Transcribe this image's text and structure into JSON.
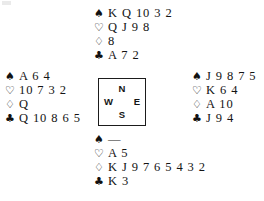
{
  "diagram": {
    "type": "bridge-hand-deal",
    "suit_symbols": {
      "spades": "♠",
      "hearts": "♡",
      "diamonds": "♢",
      "clubs": "♣"
    },
    "void_marker": "—",
    "compass": {
      "north": "N",
      "east": "E",
      "south": "S",
      "west": "W"
    },
    "hands": {
      "north": {
        "seat": "North",
        "spades": "K Q 10 3 2",
        "hearts": "Q J 9 8",
        "diamonds": "8",
        "clubs": "A 7 2"
      },
      "west": {
        "seat": "West",
        "spades": "A 6 4",
        "hearts": "10 7 3 2",
        "diamonds": "Q",
        "clubs": "Q 10 8 6 5"
      },
      "east": {
        "seat": "East",
        "spades": "J 9 8 7 5",
        "hearts": "K 6 4",
        "diamonds": "A 10",
        "clubs": "J 9 4"
      },
      "south": {
        "seat": "South",
        "spades": "—",
        "hearts": "A 5",
        "diamonds": "K J 9 7 6 5 4 3 2",
        "clubs": "K 3"
      }
    },
    "colors": {
      "background": "#ffffff",
      "ink": "#131313",
      "box_border": "#1b1b1b"
    }
  }
}
